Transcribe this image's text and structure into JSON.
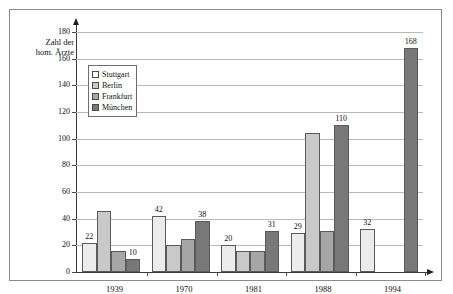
{
  "chart_data": {
    "type": "bar",
    "title": "",
    "xlabel": "",
    "ylabel": "Zahl der hom. Ärzte",
    "ylim": [
      0,
      180
    ],
    "ytick_step": 20,
    "yticks": [
      0,
      20,
      40,
      60,
      80,
      100,
      120,
      140,
      160,
      180
    ],
    "grid": true,
    "legend_position": "upper-left-inside",
    "categories": [
      "1939",
      "1970",
      "1981",
      "1988",
      "1994"
    ],
    "series": [
      {
        "name": "Stuttgart",
        "color": "#ececec",
        "values": [
          22,
          42,
          20,
          29,
          32
        ],
        "labels": [
          "22",
          "42",
          "20",
          "29",
          "32"
        ]
      },
      {
        "name": "Berlin",
        "color": "#c9c9c9",
        "values": [
          46,
          20,
          16,
          104,
          null
        ],
        "labels": [
          "",
          "",
          "",
          "",
          ""
        ]
      },
      {
        "name": "Frankfurt",
        "color": "#a6a6a6",
        "values": [
          16,
          25,
          16,
          31,
          null
        ],
        "labels": [
          "",
          "",
          "",
          "",
          ""
        ]
      },
      {
        "name": "München",
        "color": "#787878",
        "values": [
          10,
          38,
          31,
          110,
          168
        ],
        "labels": [
          "10",
          "38",
          "31",
          "110",
          "168"
        ]
      }
    ]
  },
  "axis": {
    "ylabel_line1": "Zahl der",
    "ylabel_line2": "hom. Ärzte"
  },
  "legend": {
    "items": [
      {
        "label": "Stuttgart",
        "color": "#ffffff"
      },
      {
        "label": "Berlin",
        "color": "#c9c9c9"
      },
      {
        "label": "Frankfurt",
        "color": "#a6a6a6"
      },
      {
        "label": "München",
        "color": "#787878"
      }
    ]
  }
}
